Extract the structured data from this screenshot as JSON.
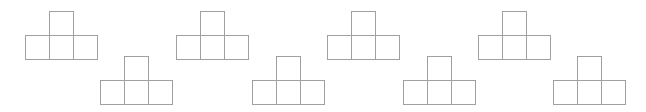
{
  "diagram": {
    "title": "",
    "stroke_color": "#a0a0a0",
    "background": "#ffffff",
    "square_size": 24,
    "shapes": [
      {
        "id": 1,
        "x": 25,
        "y": 11,
        "position": "upper"
      },
      {
        "id": 2,
        "x": 100,
        "y": 56,
        "position": "lower"
      },
      {
        "id": 3,
        "x": 176,
        "y": 11,
        "position": "upper"
      },
      {
        "id": 4,
        "x": 252,
        "y": 56,
        "position": "lower"
      },
      {
        "id": 5,
        "x": 327,
        "y": 11,
        "position": "upper"
      },
      {
        "id": 6,
        "x": 403,
        "y": 56,
        "position": "lower"
      },
      {
        "id": 7,
        "x": 478,
        "y": 11,
        "position": "upper"
      },
      {
        "id": 8,
        "x": 553,
        "y": 56,
        "position": "lower"
      }
    ]
  }
}
